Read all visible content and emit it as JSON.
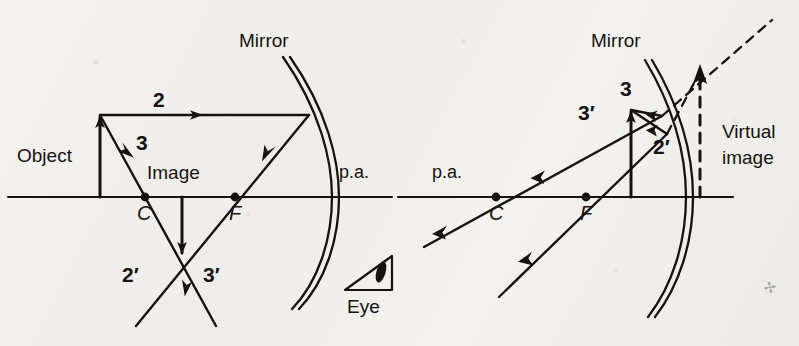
{
  "figure": {
    "background_color": "#f2f1ee",
    "ink_color": "#15120f"
  },
  "panels": [
    {
      "id": "left-panel",
      "name": "object-beyond-center-real-image",
      "labels": {
        "mirror": "Mirror",
        "object": "Object",
        "image": "Image",
        "principal_axis": "p.a.",
        "center": "C",
        "focus": "F",
        "incident_ray_2": "2",
        "incident_ray_3": "3",
        "reflected_ray_2": "2′",
        "reflected_ray_3": "3′",
        "eye": "Eye"
      },
      "geometry": {
        "principal_axis_y": 197,
        "object_x": 100,
        "object_tip_y": 115,
        "center_x": 145,
        "focus_x": 235,
        "mirror_vertex_x": 318,
        "image_x": 182,
        "image_tip_y": 257
      }
    },
    {
      "id": "right-panel",
      "name": "object-inside-focus-virtual-image",
      "labels": {
        "mirror": "Mirror",
        "principal_axis": "p.a.",
        "center": "C",
        "focus": "F",
        "incident_ray_3": "3",
        "reflected_ray_3": "3′",
        "reflected_ray_2": "2′",
        "virtual_image_line1": "Virtual",
        "virtual_image_line2": "image"
      },
      "geometry": {
        "principal_axis_y": 197,
        "center_x": 496,
        "focus_x": 586,
        "object_x": 631,
        "object_tip_y": 108,
        "mirror_vertex_x": 678,
        "virtual_image_x": 700,
        "virtual_image_tip_y": 70
      }
    }
  ],
  "icons": {
    "eye": "eye-icon",
    "mirror": "concave-mirror-icon"
  }
}
